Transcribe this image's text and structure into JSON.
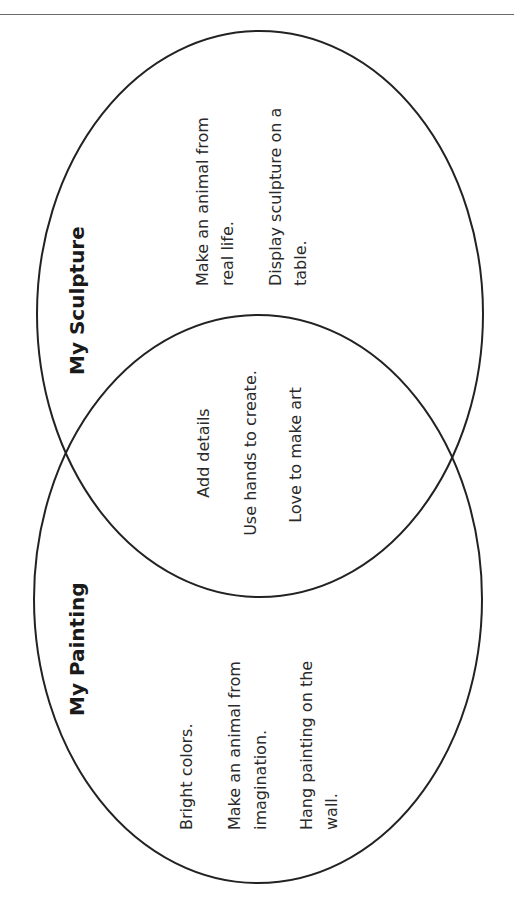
{
  "diagram": {
    "type": "venn",
    "orientation": "rotated-90-ccw",
    "stroke_color": "#222222",
    "left_set": {
      "title": "My Sculpture",
      "items": [
        {
          "lines": [
            "Make an animal from",
            "real life."
          ]
        },
        {
          "lines": [
            "Display sculpture on a",
            "table."
          ]
        }
      ]
    },
    "right_set": {
      "title": "My Painting",
      "items": [
        {
          "lines": [
            "Bright colors."
          ]
        },
        {
          "lines": [
            "Make an animal from",
            "imagination."
          ]
        },
        {
          "lines": [
            "Hang painting on the",
            "wall."
          ]
        }
      ]
    },
    "overlap": {
      "items": [
        {
          "lines": [
            "Add details"
          ]
        },
        {
          "lines": [
            "Use hands to create."
          ]
        },
        {
          "lines": [
            "Love to make art"
          ]
        }
      ]
    }
  }
}
